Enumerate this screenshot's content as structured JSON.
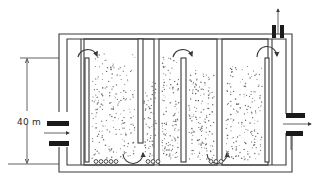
{
  "diagram": {
    "type": "schematic",
    "dimension": {
      "label": "40 m",
      "orientation": "vertical"
    },
    "chambers": [
      {
        "id": 1,
        "baffle": "hanging",
        "flow_arrow": "over-top, clockwise",
        "bottom_diffusers": 5
      },
      {
        "id": 2,
        "baffle": "hanging",
        "flow_arrow": "over-top and under-bottom",
        "bottom_diffusers": 3
      },
      {
        "id": 3,
        "baffle": "hanging",
        "flow_arrow": "over-top and under-bottom",
        "bottom_diffusers": 3
      }
    ],
    "inlet": {
      "side": "left",
      "direction": "right"
    },
    "outlet": {
      "side": "right",
      "direction": "right"
    },
    "gas_outlet": {
      "side": "top-right",
      "direction": "up"
    },
    "colors": {
      "line": "#3a3a3a",
      "fill_dark": "#1a1a1a",
      "dots": "#6a6a6a",
      "background": "#ffffff"
    }
  }
}
